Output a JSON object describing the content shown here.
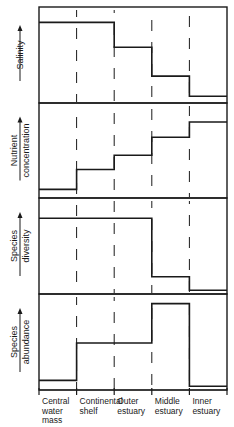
{
  "chart_data": {
    "type": "line",
    "subtype": "step-panels",
    "categories": [
      "Central water mass",
      "Continental shelf",
      "Outer estuary",
      "Middle estuary",
      "Inner estuary"
    ],
    "category_lines": [
      [
        "Central",
        "water",
        "mass"
      ],
      [
        "Continental",
        "shelf"
      ],
      [
        "Outer",
        "estuary"
      ],
      [
        "Middle",
        "estuary"
      ],
      [
        "Inner",
        "estuary"
      ]
    ],
    "panels": [
      {
        "name": "salinity",
        "ylabel_lines": [
          "Salinity"
        ],
        "values": [
          0.84,
          0.84,
          0.58,
          0.28,
          0.07
        ]
      },
      {
        "name": "nutrient-concentration",
        "ylabel_lines": [
          "Nutrient",
          "concentration"
        ],
        "values": [
          0.09,
          0.3,
          0.45,
          0.64,
          0.8
        ]
      },
      {
        "name": "species-diversity",
        "ylabel_lines": [
          "Species",
          "diversity"
        ],
        "values": [
          0.79,
          0.79,
          0.79,
          0.18,
          0.04
        ]
      },
      {
        "name": "species-abundance",
        "ylabel_lines": [
          "Species",
          "abundance"
        ],
        "values": [
          0.1,
          0.49,
          0.49,
          0.9,
          0.04
        ]
      }
    ],
    "ylim": [
      0,
      1
    ],
    "y_axis_ticks": false,
    "grid": "dashed vertical zone dividers",
    "legend": "none",
    "title": ""
  }
}
